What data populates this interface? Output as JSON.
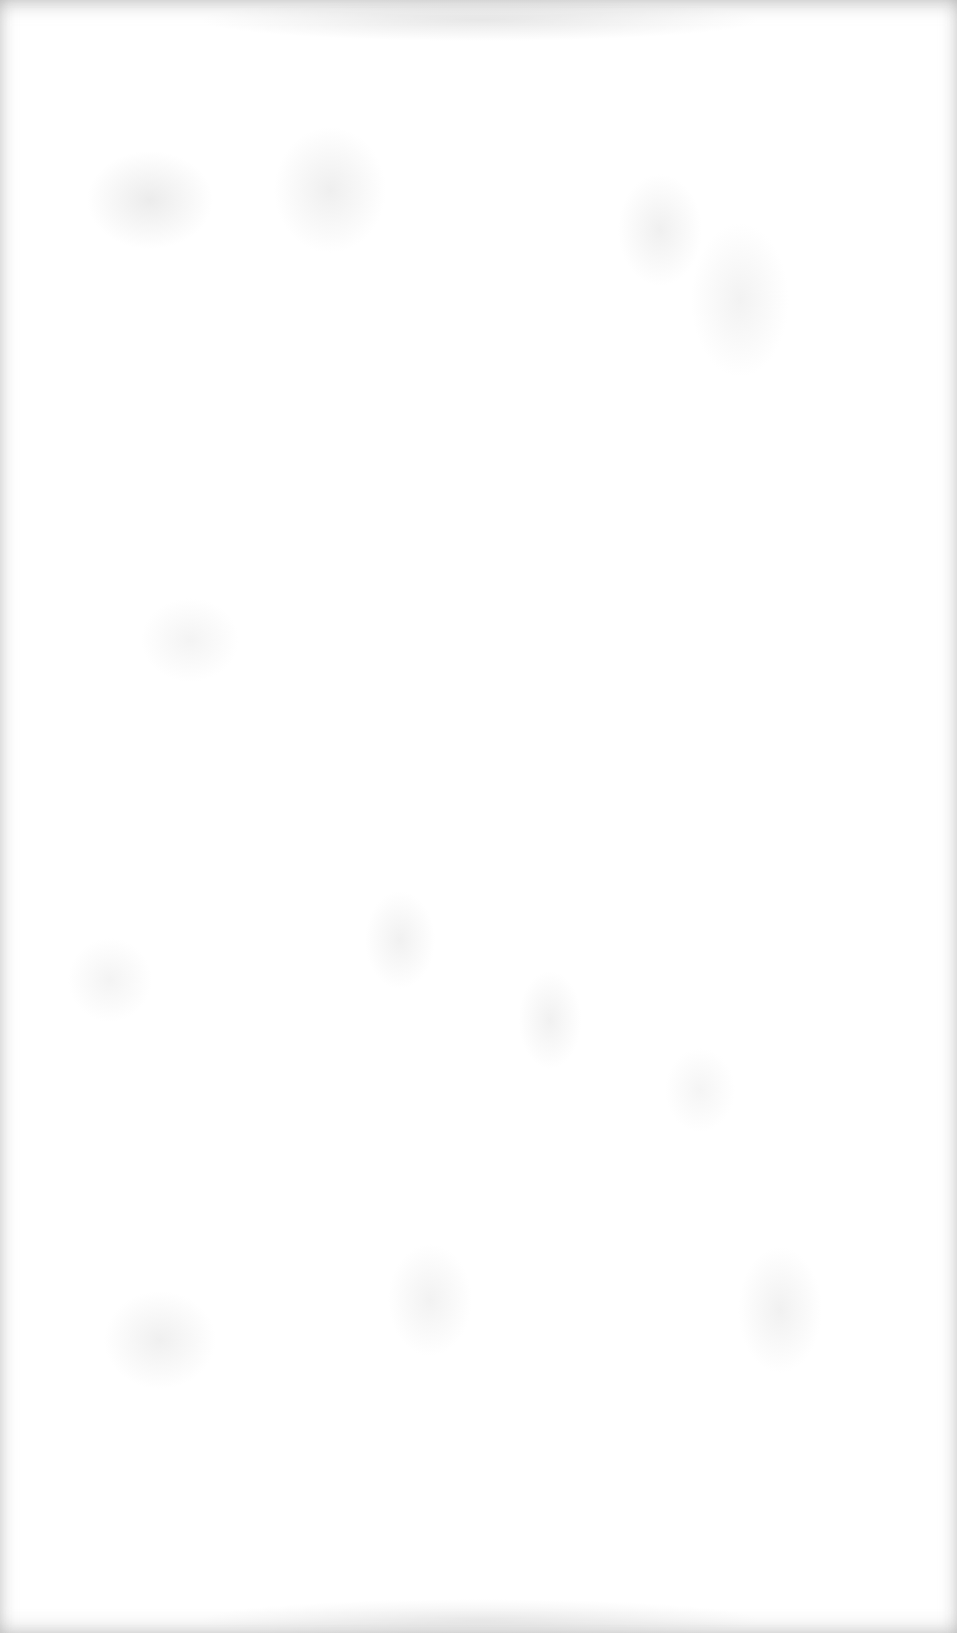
{
  "page": {
    "type": "blank-scanned-page",
    "text_content": [],
    "colors": {
      "paper": "#ffffff",
      "speckle": "#c8c8c8",
      "edge_shade": "#a0a0a0"
    }
  }
}
